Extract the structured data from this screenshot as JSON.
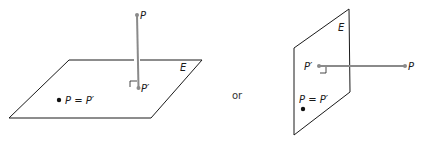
{
  "diagram": {
    "left": {
      "plane_label": "E",
      "point_label": "P",
      "projection_label": "P′",
      "equality_label": "P = P′"
    },
    "connector": "or",
    "right": {
      "plane_label": "E",
      "point_label": "P",
      "projection_label": "P′",
      "equality_label": "P = P′"
    },
    "colors": {
      "line": "#1a1a1a",
      "perpendicular": "#8a8a8a",
      "point": "#8a8a8a",
      "dot": "#111111"
    }
  }
}
